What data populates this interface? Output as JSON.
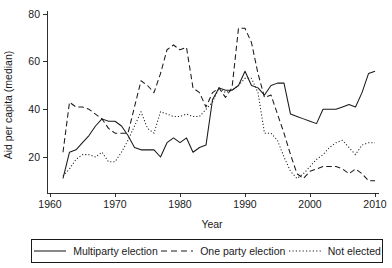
{
  "chart_data": {
    "type": "line",
    "title": "",
    "xlabel": "Year",
    "ylabel": "Aid per capita (median)",
    "xlim": [
      1960,
      2010
    ],
    "ylim": [
      8,
      82
    ],
    "grid": false,
    "legend_position": "bottom",
    "xticks": [
      1960,
      1970,
      1980,
      1990,
      2000,
      2010
    ],
    "xtick_labels": [
      "1960",
      "1970",
      "1980",
      "1990",
      "2000",
      "2010"
    ],
    "yticks": [
      20,
      40,
      60,
      80
    ],
    "ytick_labels": [
      "20",
      "40",
      "60",
      "80"
    ],
    "series": [
      {
        "name": "Multiparty election",
        "style": "solid",
        "color": "#1a1a1a",
        "x": [
          1962,
          1963,
          1964,
          1965,
          1966,
          1967,
          1968,
          1969,
          1970,
          1971,
          1972,
          1973,
          1974,
          1975,
          1976,
          1977,
          1978,
          1979,
          1980,
          1981,
          1982,
          1983,
          1984,
          1985,
          1986,
          1987,
          1988,
          1989,
          1990,
          1991,
          1992,
          1993,
          1994,
          1995,
          1996,
          1997,
          1998,
          1999,
          2000,
          2001,
          2002,
          2003,
          2004,
          2005,
          2006,
          2007,
          2008,
          2009,
          2010
        ],
        "values": [
          11,
          22,
          23,
          26,
          29,
          33,
          36,
          35,
          35,
          33,
          29,
          24,
          23,
          23,
          23,
          20,
          26,
          28,
          26,
          28,
          22,
          24,
          25,
          44,
          49,
          48,
          48,
          50,
          56,
          50,
          49,
          46,
          50,
          51,
          51,
          38,
          37,
          36,
          35,
          34,
          40,
          40,
          40,
          41,
          42,
          41,
          47,
          55,
          56
        ]
      },
      {
        "name": "One party election",
        "style": "dashed",
        "color": "#1a1a1a",
        "x": [
          1962,
          1963,
          1964,
          1965,
          1966,
          1967,
          1968,
          1969,
          1970,
          1971,
          1972,
          1973,
          1974,
          1975,
          1976,
          1977,
          1978,
          1979,
          1980,
          1981,
          1982,
          1983,
          1984,
          1985,
          1986,
          1987,
          1988,
          1989,
          1990,
          1991,
          1992,
          1993,
          1994,
          1995,
          1996,
          1997,
          1998,
          1999,
          2000,
          2001,
          2002,
          2003,
          2004,
          2005,
          2006,
          2007,
          2008,
          2009,
          2010
        ],
        "values": [
          22,
          43,
          41,
          41,
          40,
          38,
          36,
          32,
          30,
          30,
          30,
          41,
          52,
          50,
          47,
          55,
          65,
          67,
          65,
          66,
          49,
          47,
          41,
          47,
          49,
          45,
          49,
          74,
          74,
          68,
          55,
          45,
          46,
          38,
          30,
          21,
          13,
          11,
          14,
          15,
          16,
          16,
          16,
          15,
          13,
          15,
          13,
          10,
          10
        ]
      },
      {
        "name": "Not elected",
        "style": "dotted",
        "color": "#1a1a1a",
        "x": [
          1962,
          1963,
          1964,
          1965,
          1966,
          1967,
          1968,
          1969,
          1970,
          1971,
          1972,
          1973,
          1974,
          1975,
          1976,
          1977,
          1978,
          1979,
          1980,
          1981,
          1982,
          1983,
          1984,
          1985,
          1986,
          1987,
          1988,
          1989,
          1990,
          1991,
          1992,
          1993,
          1994,
          1995,
          1996,
          1997,
          1998,
          1999,
          2000,
          2001,
          2002,
          2003,
          2004,
          2005,
          2006,
          2007,
          2008,
          2009,
          2010
        ],
        "values": [
          12,
          15,
          19,
          21,
          21,
          20,
          22,
          18,
          18,
          22,
          27,
          33,
          39,
          32,
          30,
          39,
          38,
          37,
          37,
          38,
          37,
          37,
          40,
          43,
          49,
          47,
          48,
          50,
          53,
          53,
          47,
          30,
          30,
          27,
          20,
          14,
          11,
          13,
          16,
          19,
          21,
          24,
          26,
          27,
          24,
          21,
          25,
          26,
          26
        ]
      }
    ]
  },
  "legend": {
    "items": [
      {
        "label": "Multiparty election",
        "style": "solid"
      },
      {
        "label": "One party election",
        "style": "dashed"
      },
      {
        "label": "Not elected",
        "style": "dotted"
      }
    ]
  }
}
